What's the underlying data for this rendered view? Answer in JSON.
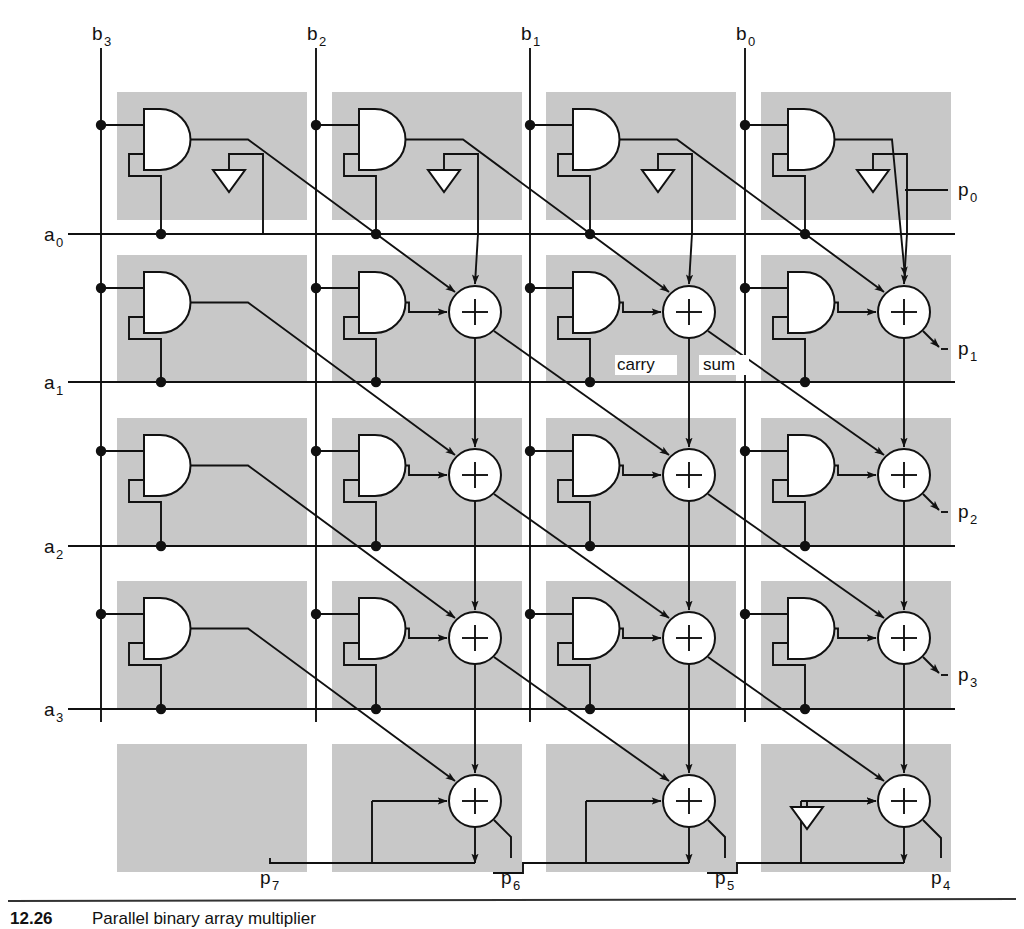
{
  "figure": {
    "title": "Parallel binary array multiplier",
    "type": "logic-circuit-diagram",
    "bit_width": 4,
    "colors": {
      "cell_fill": "#c8c8c8",
      "line": "#111111",
      "gate_fill": "#ffffff",
      "page_bg": "#ffffff"
    },
    "b_inputs": [
      {
        "name": "b3",
        "base": "b",
        "sub": "3"
      },
      {
        "name": "b2",
        "base": "b",
        "sub": "2"
      },
      {
        "name": "b1",
        "base": "b",
        "sub": "1"
      },
      {
        "name": "b0",
        "base": "b",
        "sub": "0"
      }
    ],
    "a_inputs": [
      {
        "name": "a0",
        "base": "a",
        "sub": "0"
      },
      {
        "name": "a1",
        "base": "a",
        "sub": "1"
      },
      {
        "name": "a2",
        "base": "a",
        "sub": "2"
      },
      {
        "name": "a3",
        "base": "a",
        "sub": "3"
      }
    ],
    "p_outputs_right": [
      {
        "name": "p0",
        "base": "p",
        "sub": "0"
      },
      {
        "name": "p1",
        "base": "p",
        "sub": "1"
      },
      {
        "name": "p2",
        "base": "p",
        "sub": "2"
      },
      {
        "name": "p3",
        "base": "p",
        "sub": "3"
      }
    ],
    "p_outputs_bottom": [
      {
        "name": "p7",
        "base": "p",
        "sub": "7"
      },
      {
        "name": "p6",
        "base": "p",
        "sub": "6"
      },
      {
        "name": "p5",
        "base": "p",
        "sub": "5"
      },
      {
        "name": "p4",
        "base": "p",
        "sub": "4"
      }
    ],
    "adder_port_labels": {
      "carry": "carry",
      "sum": "sum"
    },
    "adder_glyph": "+",
    "ground_symbol": "zero-constant-triangle",
    "caption": {
      "number": "12.26",
      "text": "Parallel binary array multiplier"
    }
  },
  "grid": {
    "columns": 4,
    "rows": 5,
    "cell_width": 190,
    "cell_height": 128,
    "col_x": [
      117,
      332,
      546,
      761
    ],
    "row_y": [
      92,
      255,
      418,
      581,
      744
    ],
    "a_line_y": [
      234,
      382,
      546,
      709
    ],
    "b_line_x": [
      101,
      316,
      530,
      745
    ],
    "has_and_gate": [
      [
        true,
        true,
        true,
        true
      ],
      [
        true,
        true,
        true,
        true
      ],
      [
        true,
        true,
        true,
        true
      ],
      [
        true,
        true,
        true,
        true
      ],
      [
        false,
        false,
        false,
        false
      ]
    ],
    "has_adder": [
      [
        false,
        false,
        false,
        false
      ],
      [
        false,
        true,
        true,
        true
      ],
      [
        false,
        true,
        true,
        true
      ],
      [
        false,
        true,
        true,
        true
      ],
      [
        false,
        true,
        true,
        true
      ]
    ],
    "has_ground": [
      [
        true,
        true,
        true,
        true
      ],
      [
        false,
        false,
        false,
        false
      ],
      [
        false,
        false,
        false,
        false
      ],
      [
        false,
        false,
        false,
        false
      ],
      [
        false,
        false,
        false,
        true
      ]
    ],
    "carry_sum_label_cell": {
      "row": 1,
      "col": 2
    }
  }
}
